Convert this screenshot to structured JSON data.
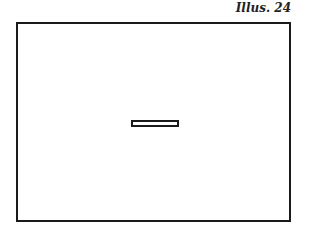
{
  "illustration": {
    "caption": "Illus. 24",
    "shapes": [
      {
        "type": "rectangle",
        "role": "outer-frame"
      },
      {
        "type": "rectangle",
        "role": "center-slot"
      }
    ]
  }
}
